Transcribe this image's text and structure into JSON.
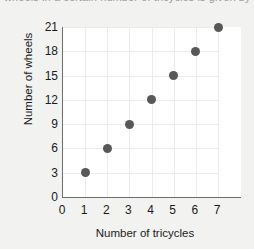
{
  "caption": {
    "clipped_text": "wheels in a certain number of tricycles is given by"
  },
  "chart_data": {
    "type": "scatter",
    "title": "",
    "xlabel": "Number of tricycles",
    "ylabel": "Number of wheels",
    "x": [
      1,
      2,
      3,
      4,
      5,
      6,
      7
    ],
    "values": [
      3,
      6,
      9,
      12,
      15,
      18,
      21
    ],
    "points": [
      {
        "x": 1,
        "y": 3
      },
      {
        "x": 2,
        "y": 6
      },
      {
        "x": 3,
        "y": 9
      },
      {
        "x": 4,
        "y": 12
      },
      {
        "x": 5,
        "y": 15
      },
      {
        "x": 6,
        "y": 18
      },
      {
        "x": 7,
        "y": 21
      }
    ],
    "xticks": [
      0,
      1,
      2,
      3,
      4,
      5,
      6,
      7
    ],
    "yticks": [
      0,
      3,
      6,
      9,
      12,
      15,
      18,
      21
    ],
    "xlim": [
      0,
      7
    ],
    "ylim": [
      0,
      21
    ],
    "grid": true,
    "legend": null,
    "marker_color": "#585858",
    "axis_color": "#6d6d6d",
    "grid_color": "#ececec",
    "plot_background": "#ffffff",
    "page_background": "#f2f2f0"
  }
}
